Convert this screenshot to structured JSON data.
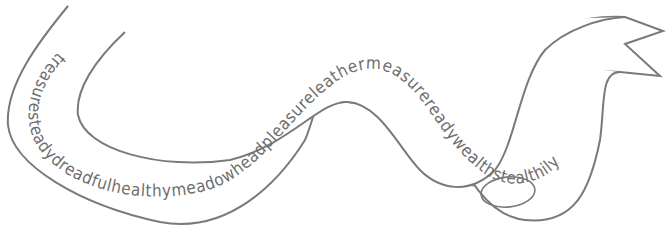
{
  "puzzle": {
    "ribbon_text": "treasuresteadydreadfulhealthymeadowheadpleasureleathermeasurereadywealthstealthily",
    "words": [
      "treasure",
      "steady",
      "dreadful",
      "healthy",
      "meadow",
      "head",
      "pleasure",
      "leather",
      "measure",
      "ready",
      "wealth",
      "stealthily"
    ],
    "circled_word": "ready"
  },
  "colors": {
    "outline": "#7a7a7a",
    "text": "#6e6e6e",
    "background": "#ffffff"
  }
}
